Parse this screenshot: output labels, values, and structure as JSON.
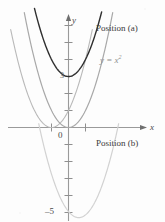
{
  "figure": {
    "background_color": "#fdfdfd",
    "axis_color": "#9a9a9a",
    "labels": {
      "y_axis": "y",
      "x_axis": "x",
      "origin": "0",
      "y_tick_negative_five": "–5",
      "y_tick_three": "3"
    },
    "annotations": {
      "position_a": "Position (a)",
      "position_b": "Position (b)",
      "base_curve": "y = x",
      "base_curve_exponent": "2"
    }
  },
  "chart_data": {
    "type": "line",
    "title": "",
    "xlabel": "x",
    "ylabel": "y",
    "xlim": [
      -3.4,
      5.6
    ],
    "ylim": [
      -6.2,
      6.6
    ],
    "grid": false,
    "legend": "inline-annotations",
    "x_ticks": [
      -1,
      1
    ],
    "x_tick_labels": [
      "",
      ""
    ],
    "y_ticks": [
      -5,
      -4,
      -3,
      -2,
      -1,
      1,
      2,
      3,
      4,
      5,
      6
    ],
    "y_tick_labels": [
      "–5",
      "",
      "",
      "",
      "",
      "",
      "",
      "3",
      "",
      "",
      ""
    ],
    "origin_label": "0",
    "series": [
      {
        "name": "Position (a)",
        "equation": "y = x^2 + 3",
        "color": "#2f2f2f",
        "width": 1.4,
        "vertex": [
          0,
          3
        ],
        "a": 1,
        "x_range": [
          -2.0,
          1.95
        ]
      },
      {
        "name": "y = x^2",
        "equation": "y = x^2",
        "color": "#a8a8a8",
        "width": 1.2,
        "vertex": [
          0,
          0
        ],
        "a": 1,
        "x_range": [
          -2.6,
          2.6
        ]
      },
      {
        "name": "shifted-left",
        "equation": "y = (x + 1)^2",
        "color": "#b9b9b9",
        "width": 1.1,
        "vertex": [
          -1,
          0
        ],
        "a": 1,
        "x_range": [
          -3.4,
          1.4
        ]
      },
      {
        "name": "Position (b)",
        "equation": "y = (x - 0.6)^2 - 5.3",
        "color": "#d2d2d2",
        "width": 1.2,
        "vertex": [
          0.6,
          -5.3
        ],
        "a": 1,
        "x_range": [
          -1.75,
          2.95
        ]
      }
    ]
  }
}
